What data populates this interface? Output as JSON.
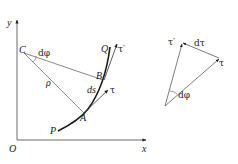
{
  "figure": {
    "left": {
      "axes": {
        "y_label": "y",
        "x_label": "x",
        "origin_label": "O"
      },
      "points": {
        "C": "C",
        "B": "B",
        "A": "A",
        "P": "P",
        "Q": "Q"
      },
      "labels": {
        "dphi": "dφ",
        "rho": "ρ",
        "ds": "ds",
        "tau": "τ",
        "tau_prime": "τ′"
      }
    },
    "right": {
      "labels": {
        "tau_prime": "τ′",
        "dtau": "dτ",
        "tau": "τ",
        "dphi": "dφ"
      }
    },
    "colors": {
      "stroke": "#333333",
      "curve": "#1a1a1a",
      "background": "#ffffff"
    }
  }
}
